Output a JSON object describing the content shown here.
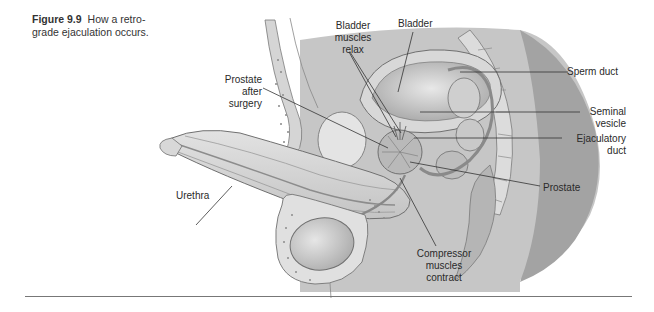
{
  "caption": {
    "number": "Figure 9.9",
    "text": "How a retro-\ngrade ejaculation occurs."
  },
  "labels": {
    "bladder_muscles_relax": "Bladder\nmuscles\nrelax",
    "bladder": "Bladder",
    "prostate_after_surgery": "Prostate\nafter\nsurgery",
    "sperm_duct": "Sperm duct",
    "seminal_vesicle": "Seminal\nvesicle",
    "ejaculatory_duct": "Ejaculatory\nduct",
    "prostate": "Prostate",
    "urethra": "Urethra",
    "compressor_muscles_contract": "Compressor\nmuscles\ncontract"
  },
  "colors": {
    "tissue_dark": "#9a9a9a",
    "tissue_mid": "#bdbdbd",
    "tissue_light": "#d9d9d9",
    "tissue_pale": "#ececec",
    "outline": "#6e6e6e",
    "leader": "#333333"
  }
}
